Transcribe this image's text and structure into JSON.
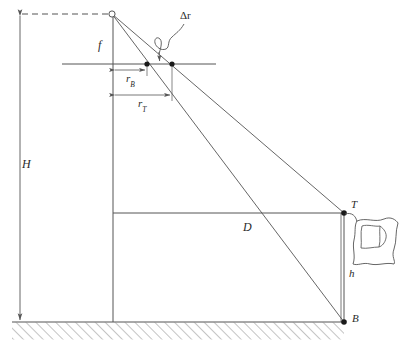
{
  "figure": {
    "background_color": "#ffffff",
    "line_color": "#555555",
    "label_color": "#2a2a2a"
  },
  "labels": {
    "flying_height": "H",
    "focal_length": "f",
    "radial_base": "r",
    "radial_base_sub": "B",
    "radial_top": "r",
    "radial_top_sub": "T",
    "relief_displacement": "Δr",
    "ground_distance": "D",
    "object_top": "T",
    "object_base": "B",
    "object_height": "h"
  },
  "geometry": {
    "perspective_center": {
      "x": 112,
      "y": 14
    },
    "image_plane_y": 64,
    "image_plane_x_start": 62,
    "image_plane_x_end": 216,
    "image_point_base": {
      "x": 147,
      "y": 64
    },
    "image_point_top": {
      "x": 172,
      "y": 64
    },
    "optical_axis_x": 113,
    "ground_line_y": 322,
    "ground_x_start": 12,
    "ground_x_end": 344,
    "datum_line_y": 213,
    "object_top_point": {
      "x": 344,
      "y": 213
    },
    "object_base_point": {
      "x": 344,
      "y": 322
    },
    "H_arrow_x": 20,
    "H_arrow_y_top": 14,
    "H_arrow_y_bottom": 322,
    "rB_dim_y": 70,
    "rT_dim_y": 95,
    "dashed_line_y": 14,
    "dashed_x_start": 20,
    "dashed_x_end": 110
  }
}
